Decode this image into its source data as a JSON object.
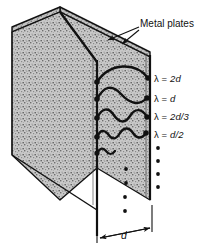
{
  "figure": {
    "type": "physics-diagram",
    "callout": {
      "label": "Metal plates",
      "leader_arrow_count": 2,
      "points_to": [
        "back-plate-top-edge",
        "front-plate-top-right-edge"
      ]
    },
    "dimension": {
      "label": "d",
      "meaning": "plate separation",
      "arrow_style": "double-headed with end ticks"
    },
    "plates": [
      {
        "name": "front-plate",
        "shading": "stippled gray"
      },
      {
        "name": "back-plate",
        "shading": "stippled gray"
      }
    ],
    "modes": [
      {
        "n": 1,
        "label_lambda": "λ",
        "label_eq": "=",
        "label_value": "2d",
        "half_waves": 1,
        "nodes": 2
      },
      {
        "n": 2,
        "label_lambda": "λ",
        "label_eq": "=",
        "label_value": "d",
        "half_waves": 2,
        "nodes": 3
      },
      {
        "n": 3,
        "label_lambda": "λ",
        "label_eq": "=",
        "label_value": "2d/3",
        "half_waves": 3,
        "nodes": 4
      },
      {
        "n": 4,
        "label_lambda": "λ",
        "label_eq": "=",
        "label_value": "d/2",
        "half_waves": 4,
        "nodes": 5
      }
    ],
    "ellipsis": [
      {
        "name": "right-ellipsis",
        "dots": 4,
        "meaning": "higher modes continue"
      },
      {
        "name": "inner-ellipsis",
        "dots": 4,
        "meaning": "higher modes continue"
      }
    ],
    "colors": {
      "ink": "#111111",
      "plate_fill": "#b9b9b9",
      "plate_edge": "#000000",
      "background": "#ffffff"
    }
  }
}
